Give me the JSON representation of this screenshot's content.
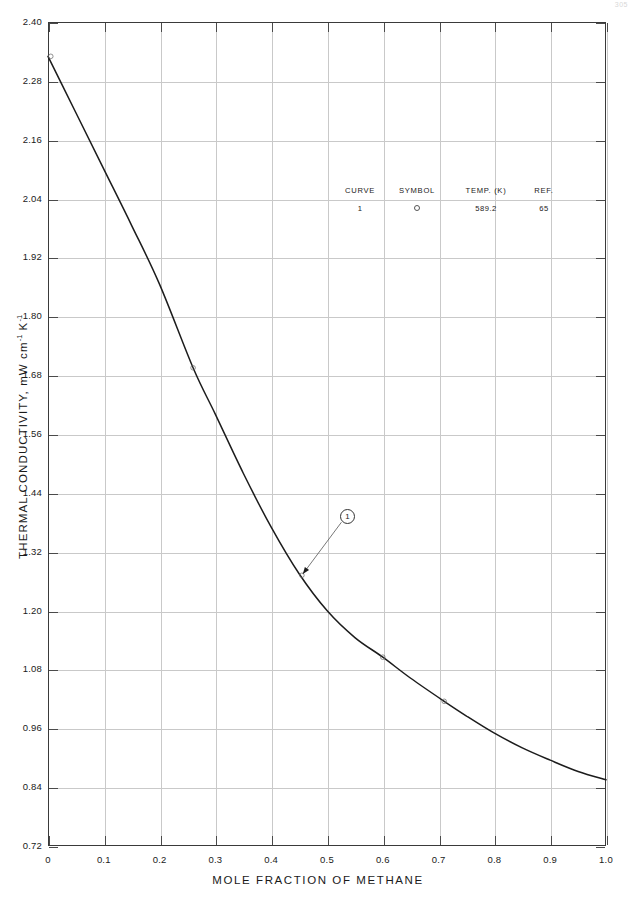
{
  "page": {
    "page_number": "305"
  },
  "chart_data": {
    "type": "line",
    "title": "",
    "xlabel": "MOLE FRACTION OF METHANE",
    "ylabel": "THERMAL CONDUCTIVITY, mW cm⁻¹ K⁻¹",
    "ylabel_main": "THERMAL CONDUCTIVITY, mW cm",
    "ylabel_sup1": "-1",
    "ylabel_mid": " K",
    "ylabel_sup2": "-1",
    "xlim": [
      0,
      1.0
    ],
    "ylim": [
      0.72,
      2.4
    ],
    "xticks": [
      "0",
      "0.1",
      "0.2",
      "0.3",
      "0.4",
      "0.5",
      "0.6",
      "0.7",
      "0.8",
      "0.9",
      "1.0"
    ],
    "xtick_values": [
      0,
      0.1,
      0.2,
      0.3,
      0.4,
      0.5,
      0.6,
      0.7,
      0.8,
      0.9,
      1.0
    ],
    "yticks": [
      "0.72",
      "0.84",
      "0.96",
      "1.08",
      "1.20",
      "1.32",
      "1.44",
      "1.56",
      "1.68",
      "1.80",
      "1.92",
      "2.04",
      "2.16",
      "2.28",
      "2.40"
    ],
    "ytick_values": [
      0.72,
      0.84,
      0.96,
      1.08,
      1.2,
      1.32,
      1.44,
      1.56,
      1.68,
      1.8,
      1.92,
      2.04,
      2.16,
      2.28,
      2.4
    ],
    "grid": true,
    "legend_position": "inside-upper-center",
    "series": [
      {
        "name": "1",
        "curve_id": "1",
        "temperature_k": "589.2",
        "reference": "65",
        "symbol": "open-circle",
        "x": [
          0.0,
          0.05,
          0.1,
          0.15,
          0.2,
          0.26,
          0.3,
          0.35,
          0.4,
          0.45,
          0.5,
          0.55,
          0.6,
          0.65,
          0.71,
          0.75,
          0.8,
          0.85,
          0.9,
          0.95,
          1.0
        ],
        "values": [
          2.33,
          2.215,
          2.1,
          1.985,
          1.865,
          1.695,
          1.6,
          1.48,
          1.37,
          1.275,
          1.2,
          1.145,
          1.105,
          1.062,
          1.015,
          0.985,
          0.95,
          0.92,
          0.895,
          0.872,
          0.855
        ],
        "markers": [
          {
            "x": 0.005,
            "y": 2.33
          },
          {
            "x": 0.26,
            "y": 1.695
          },
          {
            "x": 0.455,
            "y": 1.272
          },
          {
            "x": 0.6,
            "y": 1.105
          },
          {
            "x": 0.71,
            "y": 1.015
          }
        ]
      }
    ],
    "annotations": [
      {
        "label": "1",
        "label_x": 0.535,
        "label_y": 1.394,
        "target_x": 0.455,
        "target_y": 1.272
      }
    ]
  },
  "legend": {
    "headers": [
      "CURVE",
      "SYMBOL",
      "TEMP. (K)",
      "REF."
    ],
    "rows": [
      {
        "curve": "1",
        "symbol": "open-circle",
        "temp": "589.2",
        "ref": "65"
      }
    ]
  }
}
